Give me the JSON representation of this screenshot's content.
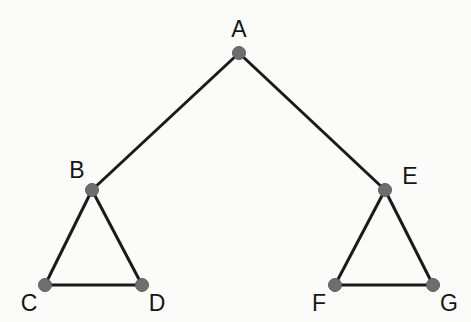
{
  "diagram": {
    "background_color": "#fbfbfa",
    "node_color": "#6e6e6e",
    "node_stroke_color": "#5d5d5d",
    "edge_color": "#1a1a1a",
    "label_color": "#151515",
    "node_radius": 6.5,
    "edge_width": 3,
    "nodes": [
      {
        "id": "A",
        "label": "A",
        "x": 239,
        "y": 53,
        "label_x": 239,
        "label_y": 29
      },
      {
        "id": "B",
        "label": "B",
        "x": 92,
        "y": 190,
        "label_x": 77,
        "label_y": 170
      },
      {
        "id": "C",
        "label": "C",
        "x": 45,
        "y": 285,
        "label_x": 29,
        "label_y": 303
      },
      {
        "id": "D",
        "label": "D",
        "x": 142,
        "y": 285,
        "label_x": 157,
        "label_y": 303
      },
      {
        "id": "E",
        "label": "E",
        "x": 385,
        "y": 190,
        "label_x": 410,
        "label_y": 176
      },
      {
        "id": "F",
        "label": "F",
        "x": 335,
        "y": 285,
        "label_x": 319,
        "label_y": 303
      },
      {
        "id": "G",
        "label": "G",
        "x": 433,
        "y": 285,
        "label_x": 449,
        "label_y": 303
      }
    ],
    "edges": [
      {
        "id": "A-B",
        "from": "A",
        "to": "B"
      },
      {
        "id": "A-E",
        "from": "A",
        "to": "E"
      },
      {
        "id": "B-C",
        "from": "B",
        "to": "C"
      },
      {
        "id": "B-D",
        "from": "B",
        "to": "D"
      },
      {
        "id": "C-D",
        "from": "C",
        "to": "D"
      },
      {
        "id": "E-F",
        "from": "E",
        "to": "F"
      },
      {
        "id": "E-G",
        "from": "E",
        "to": "G"
      },
      {
        "id": "F-G",
        "from": "F",
        "to": "G"
      }
    ]
  }
}
